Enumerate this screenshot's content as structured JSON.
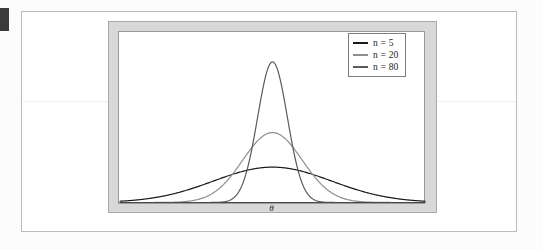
{
  "figure": {
    "xlabel": "θ",
    "background_color": "#d8d8d8",
    "plot_background_color": "#ffffff",
    "frame_border_color": "#a9a9ab"
  },
  "legend": {
    "position": "top-right",
    "border_color": "#7d7d80",
    "entries": [
      {
        "label_prefix": "n",
        "label_eq": "=",
        "label_value": "5",
        "label": "n = 5",
        "color": "#1a1a1a"
      },
      {
        "label_prefix": "n",
        "label_eq": "=",
        "label_value": "20",
        "label": "n = 20",
        "color": "#8e8e90"
      },
      {
        "label_prefix": "n",
        "label_eq": "=",
        "label_value": "80",
        "label": "n = 80",
        "color": "#5a5a5c"
      }
    ]
  },
  "marker": {
    "color": "#3b3b3d"
  },
  "chart_data": {
    "type": "line",
    "title": "",
    "subtitle": "",
    "xlabel": "θ",
    "ylabel": "",
    "grid": false,
    "legend_position": "upper right",
    "axis_visible": false,
    "x_tick_labels": [],
    "y_tick_labels": [],
    "xlim": [
      -4.0,
      4.0
    ],
    "ylim": [
      0.0,
      1.0
    ],
    "series": [
      {
        "name": "n = 5",
        "color": "#1a1a1a",
        "distribution": "normal",
        "mean": 0.0,
        "sigma": 1.55,
        "peak_height_rel": 0.215,
        "linewidth": 1.2
      },
      {
        "name": "n = 20",
        "color": "#8e8e90",
        "distribution": "normal",
        "mean": 0.0,
        "sigma": 0.78,
        "peak_height_rel": 0.425,
        "linewidth": 1.2
      },
      {
        "name": "n = 80",
        "color": "#5a5a5c",
        "distribution": "normal",
        "mean": 0.0,
        "sigma": 0.39,
        "peak_height_rel": 0.855,
        "linewidth": 1.2
      }
    ]
  }
}
